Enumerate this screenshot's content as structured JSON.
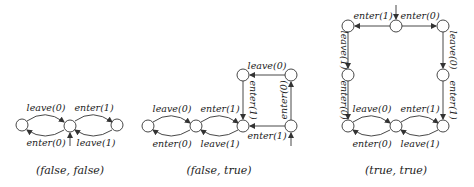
{
  "diagrams": [
    {
      "caption": "(false, false)",
      "labels": {
        "top_left": "leave(0)",
        "top_right": "enter(1)",
        "bottom_left": "enter(0)",
        "bottom_right": "leave(1)"
      }
    },
    {
      "caption": "(false, true)",
      "labels": {
        "top_left": "leave(0)",
        "top_right": "enter(1)",
        "bottom_left": "enter(0)",
        "bottom_right": "leave(1)",
        "upper_top": "leave(0)",
        "upper_left_vertical": "enter(1)",
        "upper_right_vertical": "enter(0)",
        "upper_bottom": "enter(1)"
      }
    },
    {
      "caption": "(true, true)",
      "labels": {
        "top_left": "enter(1)",
        "top_right": "enter(0)",
        "left_upper_vertical": "leave(1)",
        "left_lower_vertical": "enter(0)",
        "right_upper_vertical": "leave(0)",
        "right_lower_vertical": "enter(1)",
        "bottom_top_left": "leave(0)",
        "bottom_top_right": "enter(1)",
        "bottom_bottom_left": "enter(0)",
        "bottom_bottom_right": "leave(1)"
      }
    }
  ]
}
